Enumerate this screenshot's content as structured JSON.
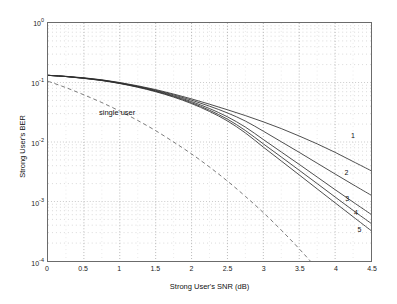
{
  "chart_data": {
    "type": "line",
    "title": "",
    "xlabel": "Strong User's SNR  (dB)",
    "ylabel": "Strong User's BER",
    "xlim": [
      0,
      4.5
    ],
    "ylim": [
      0.0001,
      1
    ],
    "yscale": "log",
    "grid": true,
    "legend_position": "inline-right-labels",
    "xticks": [
      "0",
      "0.5",
      "1",
      "1.5",
      "2",
      "2.5",
      "3",
      "3.5",
      "4",
      "4.5"
    ],
    "xtick_values": [
      0,
      0.5,
      1,
      1.5,
      2,
      2.5,
      3,
      3.5,
      4,
      4.5
    ],
    "yticks": [
      "10^0",
      "10^-1",
      "10^-2",
      "10^-3",
      "10^-4"
    ],
    "ytick_values": [
      1,
      0.1,
      0.01,
      0.001,
      0.0001
    ],
    "annotations": [
      {
        "text": "single user",
        "x": 0.72,
        "y": 0.03
      }
    ],
    "series": [
      {
        "name": "single user",
        "label": "single user",
        "style": "dashed",
        "color": "#5a5a5a",
        "x": [
          0,
          0.25,
          0.5,
          0.75,
          1.0,
          1.25,
          1.5,
          1.75,
          2.0,
          2.25,
          2.5,
          2.75,
          3.0,
          3.25,
          3.5,
          3.75,
          4.0,
          4.08
        ],
        "values": [
          0.105,
          0.082,
          0.062,
          0.046,
          0.033,
          0.023,
          0.0155,
          0.01,
          0.0063,
          0.0038,
          0.0022,
          0.00122,
          0.00065,
          0.00033,
          0.00016,
          7.4e-05,
          3.3e-05,
          2.5e-05
        ]
      },
      {
        "name": "curve-1",
        "label": "1",
        "style": "solid",
        "color": "#2e2e2e",
        "x": [
          0,
          0.25,
          0.5,
          0.75,
          1.0,
          1.25,
          1.5,
          1.75,
          2.0,
          2.25,
          2.5,
          2.75,
          3.0,
          3.25,
          3.5,
          3.75,
          4.0,
          4.25,
          4.5
        ],
        "values": [
          0.132,
          0.127,
          0.12,
          0.111,
          0.1,
          0.088,
          0.076,
          0.064,
          0.053,
          0.0432,
          0.0348,
          0.0278,
          0.0218,
          0.0168,
          0.0126,
          0.0093,
          0.0067,
          0.0047,
          0.0033
        ]
      },
      {
        "name": "curve-2",
        "label": "2",
        "style": "solid",
        "color": "#2e2e2e",
        "x": [
          0,
          0.25,
          0.5,
          0.75,
          1.0,
          1.25,
          1.5,
          1.75,
          2.0,
          2.25,
          2.5,
          2.75,
          3.0,
          3.25,
          3.5,
          3.75,
          4.0,
          4.25,
          4.5
        ],
        "values": [
          0.132,
          0.126,
          0.119,
          0.11,
          0.0985,
          0.0865,
          0.0742,
          0.062,
          0.0505,
          0.04,
          0.0308,
          0.0225,
          0.0152,
          0.0101,
          0.0067,
          0.0044,
          0.0029,
          0.00192,
          0.00128
        ]
      },
      {
        "name": "curve-3",
        "label": "3",
        "style": "solid",
        "color": "#2e2e2e",
        "x": [
          0,
          0.25,
          0.5,
          0.75,
          1.0,
          1.25,
          1.5,
          1.75,
          2.0,
          2.25,
          2.5,
          2.75,
          3.0,
          3.25,
          3.5,
          3.75,
          4.0,
          4.25,
          4.5
        ],
        "values": [
          0.132,
          0.126,
          0.118,
          0.109,
          0.0975,
          0.0852,
          0.0725,
          0.0598,
          0.0478,
          0.0365,
          0.0265,
          0.0178,
          0.011,
          0.0068,
          0.0042,
          0.00258,
          0.00158,
          0.00098,
          0.00061
        ]
      },
      {
        "name": "curve-4",
        "label": "4",
        "style": "solid",
        "color": "#2e2e2e",
        "x": [
          0,
          0.25,
          0.5,
          0.75,
          1.0,
          1.25,
          1.5,
          1.75,
          2.0,
          2.25,
          2.5,
          2.75,
          3.0,
          3.25,
          3.5,
          3.75,
          4.0,
          4.25,
          4.5
        ],
        "values": [
          0.132,
          0.126,
          0.118,
          0.108,
          0.0968,
          0.0842,
          0.0712,
          0.0582,
          0.0458,
          0.0342,
          0.0242,
          0.0156,
          0.0093,
          0.0056,
          0.00335,
          0.002,
          0.00119,
          0.00071,
          0.00043
        ]
      },
      {
        "name": "curve-5",
        "label": "5",
        "style": "solid",
        "color": "#2e2e2e",
        "x": [
          0,
          0.25,
          0.5,
          0.75,
          1.0,
          1.25,
          1.5,
          1.75,
          2.0,
          2.25,
          2.5,
          2.75,
          3.0,
          3.25,
          3.5,
          3.75,
          4.0,
          4.25,
          4.5
        ],
        "values": [
          0.132,
          0.126,
          0.117,
          0.108,
          0.096,
          0.0832,
          0.07,
          0.0568,
          0.0442,
          0.0326,
          0.0226,
          0.0142,
          0.0082,
          0.0048,
          0.0028,
          0.00163,
          0.00095,
          0.000555,
          0.000325
        ]
      }
    ],
    "curve_labels": [
      {
        "text": "1",
        "x": 4.21,
        "y": 0.012
      },
      {
        "text": "2",
        "x": 4.12,
        "y": 0.0029
      },
      {
        "text": "3",
        "x": 4.13,
        "y": 0.0011
      },
      {
        "text": "4",
        "x": 4.25,
        "y": 0.00064
      },
      {
        "text": "5",
        "x": 4.3,
        "y": 0.00033
      }
    ]
  }
}
